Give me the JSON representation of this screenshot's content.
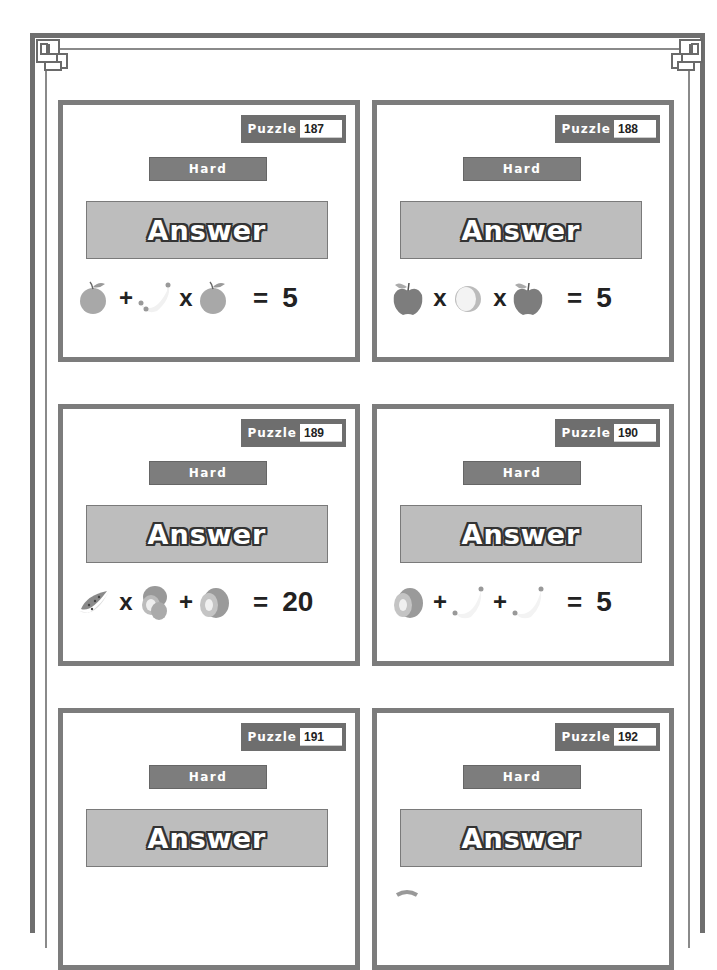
{
  "page": {
    "frame_style": "double border with corner ornaments"
  },
  "cards": [
    {
      "puzzle_label": "Puzzle",
      "puzzle_number": "187",
      "difficulty": "Hard",
      "answer_label": "Answer",
      "equation": {
        "terms": [
          "orange-icon",
          "banana-icon",
          "orange-icon"
        ],
        "operators": [
          "+",
          "x"
        ],
        "equals": "=",
        "result": "5"
      }
    },
    {
      "puzzle_label": "Puzzle",
      "puzzle_number": "188",
      "difficulty": "Hard",
      "answer_label": "Answer",
      "equation": {
        "terms": [
          "apple-icon",
          "lemon-half-icon",
          "apple-icon"
        ],
        "operators": [
          "x",
          "x"
        ],
        "equals": "=",
        "result": "5"
      }
    },
    {
      "puzzle_label": "Puzzle",
      "puzzle_number": "189",
      "difficulty": "Hard",
      "answer_label": "Answer",
      "equation": {
        "terms": [
          "watermelon-slice-icon",
          "kiwi-pair-icon",
          "kiwi-icon"
        ],
        "operators": [
          "x",
          "+"
        ],
        "equals": "=",
        "result": "20"
      }
    },
    {
      "puzzle_label": "Puzzle",
      "puzzle_number": "190",
      "difficulty": "Hard",
      "answer_label": "Answer",
      "equation": {
        "terms": [
          "kiwi-icon",
          "banana-icon",
          "banana-icon"
        ],
        "operators": [
          "+",
          "+"
        ],
        "equals": "=",
        "result": "5"
      }
    },
    {
      "puzzle_label": "Puzzle",
      "puzzle_number": "191",
      "difficulty": "Hard",
      "answer_label": "Answer"
    },
    {
      "puzzle_label": "Puzzle",
      "puzzle_number": "192",
      "difficulty": "Hard",
      "answer_label": "Answer"
    }
  ],
  "colors": {
    "frame": "#6f6f6f",
    "card_border": "#7c7c7c",
    "tag_bg": "#6e6e6e",
    "difficulty_bg": "#7d7d7d",
    "answer_bg": "#bdbdbd"
  }
}
